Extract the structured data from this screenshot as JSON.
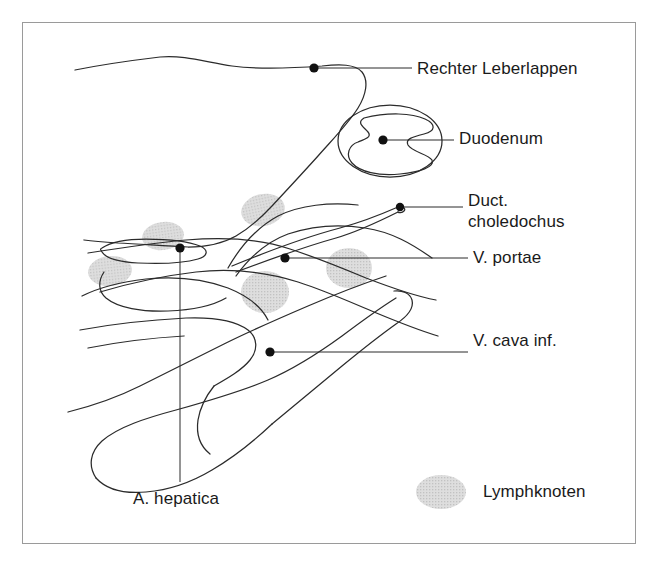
{
  "figure": {
    "type": "anatomical-line-diagram",
    "language": "de",
    "frame": {
      "border_color": "#9a9a9a",
      "background": "#ffffff"
    },
    "stroke_color": "#2b2b2b",
    "marker_color": "#111111",
    "lymph_node_fill": "#d6d6d6",
    "text_color": "#1a1a1a"
  },
  "labels": [
    {
      "id": "rechter-leberlappen",
      "text": "Rechter Leberlappen",
      "marker": {
        "x": 314,
        "y": 68
      },
      "leader_to": {
        "x": 412,
        "y": 68
      },
      "lines": 1
    },
    {
      "id": "duodenum",
      "text": "Duodenum",
      "marker": {
        "x": 383,
        "y": 140
      },
      "leader_to": {
        "x": 454,
        "y": 140
      },
      "lines": 1
    },
    {
      "id": "duct-choledochus",
      "text": "Duct.\ncholedochus",
      "line1": "Duct.",
      "line2": "choledochus",
      "marker": {
        "x": 400,
        "y": 207
      },
      "leader_to": {
        "x": 463,
        "y": 207
      },
      "lines": 2
    },
    {
      "id": "v-portae",
      "text": "V. portae",
      "marker": {
        "x": 285,
        "y": 258
      },
      "leader_to": {
        "x": 468,
        "y": 258
      },
      "lines": 1
    },
    {
      "id": "v-cava-inf",
      "text": "V. cava inf.",
      "marker": {
        "x": 270,
        "y": 352
      },
      "leader_to": {
        "x": 468,
        "y": 352
      },
      "lines": 1
    },
    {
      "id": "a-hepatica",
      "text": "A. hepatica",
      "marker": {
        "x": 180,
        "y": 248
      },
      "leader_to": {
        "x": 180,
        "y": 482
      },
      "lines": 1
    }
  ],
  "legend": {
    "swatch_shape": "ellipse",
    "swatch_fill": "#d6d6d6",
    "label": "Lymphknoten"
  },
  "lymph_nodes": [
    {
      "cx": 263,
      "cy": 210,
      "rx": 22,
      "ry": 16,
      "rot": -12
    },
    {
      "cx": 163,
      "cy": 236,
      "rx": 21,
      "ry": 14,
      "rot": -8
    },
    {
      "cx": 110,
      "cy": 271,
      "rx": 22,
      "ry": 15,
      "rot": -6
    },
    {
      "cx": 265,
      "cy": 292,
      "rx": 24,
      "ry": 21,
      "rot": 0
    },
    {
      "cx": 349,
      "cy": 268,
      "rx": 23,
      "ry": 20,
      "rot": 0
    }
  ],
  "structures": [
    {
      "id": "liver-outline",
      "name": "Rechter Leberlappen"
    },
    {
      "id": "duodenum-outer-wall",
      "name": "Duodenum Aussenwand"
    },
    {
      "id": "duodenum-lumen",
      "name": "Duodenum Lumen"
    },
    {
      "id": "ductus-choledochus",
      "name": "Ductus choledochus"
    },
    {
      "id": "vena-portae",
      "name": "Vena portae"
    },
    {
      "id": "vena-cava-inferior",
      "name": "Vena cava inferior"
    },
    {
      "id": "arteria-hepatica",
      "name": "Arteria hepatica"
    }
  ]
}
